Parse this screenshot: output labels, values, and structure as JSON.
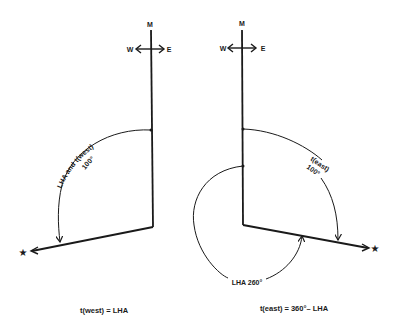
{
  "diagrams": [
    {
      "id": "west",
      "meridian_label": "M",
      "west_label": "W",
      "east_label": "E",
      "arc_label_line1": "LHA and t(west)",
      "arc_label_line2": "100°",
      "caption": "t(west) = LHA"
    },
    {
      "id": "east",
      "meridian_label": "M",
      "west_label": "W",
      "east_label": "E",
      "arc_label_line1": "t(east)",
      "arc_label_line2": "100°",
      "inner_arc_label": "LHA 260°",
      "caption": "t(east) = 360°– LHA"
    }
  ],
  "colors": {
    "ink": "#1a1a1a",
    "background": "#ffffff"
  }
}
